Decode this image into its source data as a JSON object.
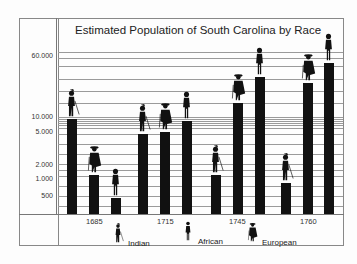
{
  "chart_data": {
    "type": "bar",
    "title": "Estimated Population of South Carolina by Race",
    "xlabel": "",
    "ylabel": "",
    "yscale": "log",
    "ylim": [
      300,
      70000
    ],
    "grid": true,
    "legend_position": "bottom",
    "y_tick_labels": [
      "60.000",
      "10.000",
      "5.000",
      "2.000",
      "1.000",
      "500"
    ],
    "categories": [
      "1685",
      "1715",
      "1745",
      "1760"
    ],
    "series": [
      {
        "name": "Indian",
        "values": [
          10000,
          5100,
          1400,
          750
        ]
      },
      {
        "name": "European",
        "values": [
          1400,
          5500,
          20000,
          30000
        ]
      },
      {
        "name": "African",
        "values": [
          500,
          9000,
          40000,
          57000
        ]
      }
    ]
  },
  "title": "Estimated Population of South Carolina by Race",
  "yaxis": [
    {
      "label": "60.000",
      "y": 52
    },
    {
      "label": "10.000",
      "y": 113
    },
    {
      "label": "5.000",
      "y": 128
    },
    {
      "label": "2.000",
      "y": 161
    },
    {
      "label": "1.000",
      "y": 175
    },
    {
      "label": "500",
      "y": 192
    }
  ],
  "gridlines": [
    52,
    58,
    66,
    79,
    91,
    103,
    117,
    119,
    121,
    123,
    125,
    128,
    134,
    144,
    154,
    164,
    170,
    176,
    186,
    196,
    206
  ],
  "bars": [
    {
      "x": 67,
      "top": 119,
      "kind": "indian"
    },
    {
      "x": 89,
      "top": 175,
      "kind": "european"
    },
    {
      "x": 111,
      "top": 198,
      "kind": "african"
    },
    {
      "x": 138,
      "top": 134,
      "kind": "indian"
    },
    {
      "x": 160,
      "top": 132,
      "kind": "european"
    },
    {
      "x": 182,
      "top": 121,
      "kind": "african"
    },
    {
      "x": 211,
      "top": 175,
      "kind": "indian"
    },
    {
      "x": 233,
      "top": 103,
      "kind": "european"
    },
    {
      "x": 255,
      "top": 77,
      "kind": "african"
    },
    {
      "x": 281,
      "top": 183,
      "kind": "indian"
    },
    {
      "x": 303,
      "top": 83,
      "kind": "european"
    },
    {
      "x": 324,
      "top": 63,
      "kind": "african"
    }
  ],
  "xaxis": [
    {
      "label": "1685",
      "x": 86
    },
    {
      "label": "1715",
      "x": 157
    },
    {
      "label": "1745",
      "x": 229
    },
    {
      "label": "1760",
      "x": 300
    }
  ],
  "legend": [
    {
      "label": "Indian",
      "kind": "indian"
    },
    {
      "label": "African",
      "kind": "african"
    },
    {
      "label": "European",
      "kind": "european"
    }
  ],
  "colors": {
    "bar": "#111111",
    "grid": "#9a9a9a",
    "background": "#fdfdfd"
  }
}
